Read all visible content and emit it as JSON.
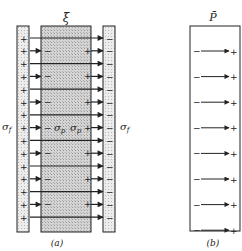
{
  "panel_a": {
    "field_label": "ξ̄",
    "left_charge_label": "σ",
    "left_charge_sub": "f",
    "right_charge_label": "σ",
    "right_charge_sub": "f",
    "inner_left_label": "σ",
    "inner_left_sub": "p",
    "inner_right_label": "σ",
    "inner_right_sub": "p",
    "caption": "(a)",
    "plus_sign": "+",
    "minus_sign": "−",
    "rows": 15
  },
  "panel_b": {
    "field_label": "P̄",
    "caption": "(b)",
    "plus_sign": "+",
    "minus_sign": "−",
    "rows": 8
  },
  "colors": {
    "line": "#222222",
    "plate_fill": "#e4e4e4",
    "dielectric_fill": "#c9c9c9",
    "background": "#ffffff"
  }
}
